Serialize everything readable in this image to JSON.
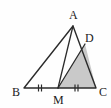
{
  "figure": {
    "type": "geometry-diagram",
    "background_color": "#fefefe",
    "stroke_color": "#2b2b2b",
    "shaded_fill_color": "#c9c9c9",
    "labels": {
      "a": "A",
      "b": "B",
      "c": "C",
      "d": "D",
      "m": "M"
    },
    "points": {
      "A": {
        "x": 73,
        "y": 26
      },
      "B": {
        "x": 24,
        "y": 88
      },
      "C": {
        "x": 96,
        "y": 88
      },
      "D": {
        "x": 85,
        "y": 44
      },
      "M": {
        "x": 58,
        "y": 88
      }
    },
    "segments": [
      {
        "name": "AB",
        "from": "A",
        "to": "B"
      },
      {
        "name": "BC",
        "from": "B",
        "to": "C"
      },
      {
        "name": "AC",
        "from": "A",
        "to": "C"
      },
      {
        "name": "AM",
        "from": "A",
        "to": "M"
      },
      {
        "name": "DM",
        "from": "D",
        "to": "M"
      }
    ],
    "shaded_region": {
      "name": "triangle-DMC",
      "vertices": [
        "D",
        "M",
        "C"
      ]
    },
    "tick_marks": [
      {
        "segment": "BM",
        "count": 2
      },
      {
        "segment": "MC",
        "count": 2
      }
    ]
  }
}
